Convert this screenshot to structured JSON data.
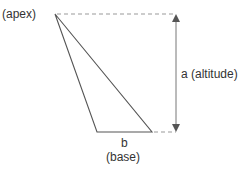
{
  "diagram": {
    "labels": {
      "apex": "(apex)",
      "altitude": "a (altitude)",
      "base_symbol": "b",
      "base": "(base)"
    },
    "colors": {
      "line": "#555555",
      "dashed": "#999999",
      "text": "#333333"
    },
    "geometry": {
      "apex": [
        55,
        14
      ],
      "base_left": [
        97,
        132
      ],
      "base_right": [
        152,
        132
      ],
      "altitude_x": 176
    }
  }
}
